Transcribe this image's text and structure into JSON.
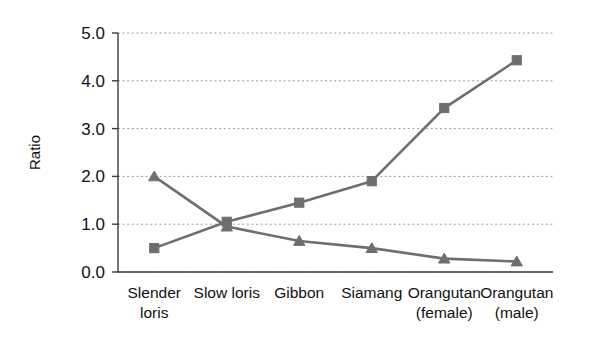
{
  "chart_data": {
    "type": "line",
    "title": "",
    "subtitle": "",
    "xlabel": "",
    "ylabel": "Ratio",
    "categories": [
      "Slender loris",
      "Slow loris",
      "Gibbon",
      "Siamang",
      "Orangutan (female)",
      "Orangutan (male)"
    ],
    "category_lines": [
      [
        "Slender",
        "loris"
      ],
      [
        "Slow loris"
      ],
      [
        "Gibbon"
      ],
      [
        "Siamang"
      ],
      [
        "Orangutan",
        "(female)"
      ],
      [
        "Orangutan",
        "(male)"
      ]
    ],
    "series": [
      {
        "name": "Rising series",
        "marker": "square",
        "color": "#6e6e6e",
        "values": [
          0.5,
          1.05,
          1.45,
          1.9,
          3.43,
          4.43
        ]
      },
      {
        "name": "Falling series",
        "marker": "triangle",
        "color": "#6e6e6e",
        "values": [
          2.0,
          0.95,
          0.65,
          0.5,
          0.28,
          0.22
        ]
      }
    ],
    "ylim": [
      0.0,
      5.0
    ],
    "ytick_values": [
      0.0,
      1.0,
      2.0,
      3.0,
      4.0,
      5.0
    ],
    "ytick_labels": [
      "0.0",
      "1.0",
      "2.0",
      "3.0",
      "4.0",
      "5.0"
    ],
    "grid": true,
    "grid_axis": "y",
    "grid_color": "#9a9a9a",
    "legend": false,
    "legend_position": "none",
    "axis_color": "#3a3a3a",
    "background_color": "#ffffff"
  }
}
